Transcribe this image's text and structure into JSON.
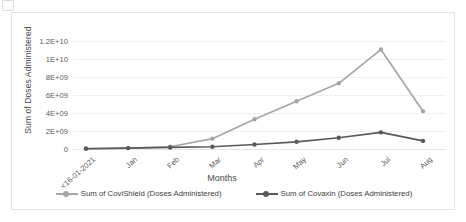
{
  "chart_data": {
    "type": "line",
    "title": "",
    "xlabel": "Months",
    "ylabel": "Sum of Doses Administered",
    "categories": [
      "<16-01-2021",
      "Jan",
      "Feb",
      "Mar",
      "Apr",
      "May",
      "Jun",
      "Jul",
      "Aug"
    ],
    "ylim": [
      0,
      12000000000
    ],
    "ytick_values": [
      0,
      2000000000,
      4000000000,
      6000000000,
      8000000000,
      10000000000,
      12000000000
    ],
    "ytick_labels": [
      "0",
      "2E+09",
      "4E+09",
      "6E+09",
      "8E+09",
      "1E+10",
      "1.2E+10"
    ],
    "grid": true,
    "legend_position": "bottom",
    "series": [
      {
        "name": "Sum of CoviShield (Doses Administered)",
        "color": "#a6a6a6",
        "values": [
          50000000,
          100000000,
          250000000,
          1150000000,
          3300000000,
          5300000000,
          7300000000,
          11050000000,
          4200000000
        ]
      },
      {
        "name": "Sum of  Covaxin (Doses Administered)",
        "color": "#595959",
        "values": [
          30000000,
          100000000,
          170000000,
          250000000,
          500000000,
          800000000,
          1250000000,
          1850000000,
          900000000
        ]
      }
    ]
  },
  "colors": {
    "covishield": "#a6a6a6",
    "covaxin": "#595959",
    "gridline": "#efefef",
    "frame": "#e3e3e3",
    "text": "#5a5a5a"
  }
}
